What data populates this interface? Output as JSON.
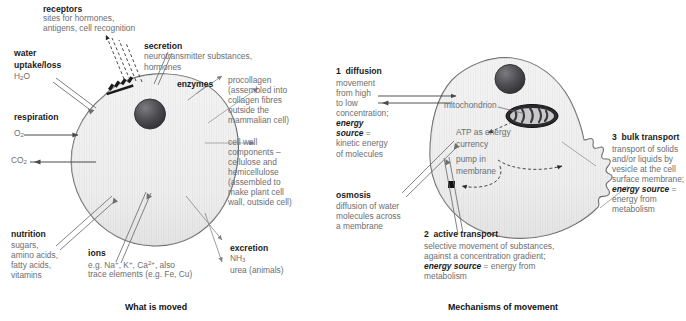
{
  "captions": {
    "left": "What is moved",
    "right": "Mechanisms of movement"
  },
  "left_panel": {
    "receptors": {
      "title": "receptors",
      "line1": "sites for hormones,",
      "line2": "antigens, cell recognition"
    },
    "water": {
      "title1": "water",
      "title2": "uptake/loss",
      "formula": "H2O"
    },
    "respiration": {
      "title": "respiration",
      "gas_in": "O2",
      "gas_out": "CO2"
    },
    "secretion": {
      "title": "secretion",
      "line1": "neurotransmitter substances,",
      "line2": "hormones"
    },
    "enzymes": {
      "title": "enzymes",
      "lines": [
        "procollagen",
        "(assembled into",
        "collagen fibres",
        "outside the",
        "mammalian cell)"
      ]
    },
    "cell_wall": {
      "lines": [
        "cell wall",
        "components –",
        "cellulose and",
        "hemicellulose",
        "(assembled to",
        "make plant cell",
        "wall, outside cell)"
      ]
    },
    "nutrition": {
      "title": "nutrition",
      "lines": [
        "sugars,",
        "amino acids,",
        "fatty acids,",
        "vitamins"
      ]
    },
    "ions": {
      "title": "ions",
      "line1_pre": "e.g. Na",
      "line1_mid": ", K",
      "line1_mid2": ", Ca",
      "line1_post": ", also",
      "sup_plus": "+",
      "sup_2plus": "2+",
      "line2": "trace elements (e.g. Fe, Cu)"
    },
    "excretion": {
      "title": "excretion",
      "line1": "NH3",
      "line2": "urea (animals)"
    }
  },
  "right_panel": {
    "diffusion": {
      "number": "1",
      "title": "diffusion",
      "lines": [
        "movement",
        "from high",
        "to low",
        "concentration;"
      ],
      "energy_label_1": "energy",
      "energy_label_2": "source",
      "equals": "=",
      "lines2": [
        "kinetic energy",
        "of molecules"
      ]
    },
    "osmosis": {
      "title": "osmosis",
      "lines": [
        "diffusion of water",
        "molecules across",
        "a membrane"
      ]
    },
    "active_transport": {
      "number": "2",
      "title": "active transport",
      "line1": "selective movement of substances,",
      "line2": "against a concentration gradient;",
      "energy_label": "energy source",
      "energy_rest": " = energy from",
      "line3": "metabolism"
    },
    "bulk_transport": {
      "number": "3",
      "title": "bulk transport",
      "lines": [
        "transport of solids",
        "and/or liquids by",
        "vesicle at the cell",
        "surface membrane;"
      ],
      "energy_label": "energy source",
      "equals": "=",
      "lines2": [
        "energy from",
        "metabolism"
      ]
    },
    "internal_labels": {
      "mitochondrion": "mitochondrion",
      "atp_line1": "ATP as energy",
      "atp_line2": "currency",
      "pump_line1": "pump in",
      "pump_line2": "membrane"
    }
  },
  "colors": {
    "cell_fill": "#efefef",
    "cell_stroke": "#58595b",
    "nucleus_dark": "#3a3a3c",
    "text_grey": "#6d6e71",
    "text_dark": "#1b1b1b",
    "arrow": "#808285"
  }
}
